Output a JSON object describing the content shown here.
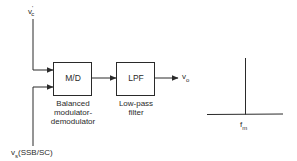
{
  "diagram": {
    "inputs": {
      "carrier": {
        "base": "v",
        "sup": "'",
        "sub": "c"
      },
      "signal": {
        "base": "v",
        "sub": "s",
        "suffix": "(SSB/SC)"
      }
    },
    "blocks": [
      {
        "id": "md",
        "label": "M/D",
        "caption_lines": [
          "Balanced",
          "modulator-",
          "demodulator"
        ]
      },
      {
        "id": "lpf",
        "label": "LPF",
        "caption_lines": [
          "Low-pass",
          "filter"
        ]
      }
    ],
    "output": {
      "base": "v",
      "sub": "o"
    },
    "spectrum": {
      "marker": {
        "base": "f",
        "sub": "m"
      }
    },
    "colors": {
      "line": "#2a2a2a",
      "background": "#ffffff"
    }
  }
}
